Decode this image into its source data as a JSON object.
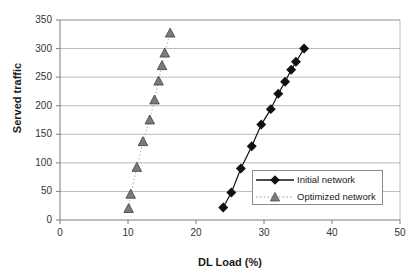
{
  "chart_data": {
    "type": "scatter",
    "title": "",
    "xlabel": "DL Load (%)",
    "ylabel": "Served traffic",
    "xlim": [
      0,
      50
    ],
    "ylim": [
      0,
      350
    ],
    "xticks": [
      0,
      10,
      20,
      30,
      40,
      50
    ],
    "yticks": [
      0,
      50,
      100,
      150,
      200,
      250,
      300,
      350
    ],
    "grid": "horizontal",
    "legend_position": "inside-lower-right",
    "series": [
      {
        "name": "Initial network",
        "marker": "diamond",
        "color": "#111111",
        "line": "solid",
        "points": [
          {
            "x": 24.0,
            "y": 22
          },
          {
            "x": 25.2,
            "y": 48
          },
          {
            "x": 26.6,
            "y": 90
          },
          {
            "x": 28.2,
            "y": 129
          },
          {
            "x": 29.6,
            "y": 167
          },
          {
            "x": 31.0,
            "y": 194
          },
          {
            "x": 32.1,
            "y": 221
          },
          {
            "x": 33.1,
            "y": 242
          },
          {
            "x": 34.0,
            "y": 263
          },
          {
            "x": 34.7,
            "y": 277
          },
          {
            "x": 35.9,
            "y": 300
          }
        ]
      },
      {
        "name": "Optimized network",
        "marker": "triangle",
        "color": "#6e6e6e",
        "line": "dotted",
        "points": [
          {
            "x": 10.1,
            "y": 20
          },
          {
            "x": 10.4,
            "y": 45
          },
          {
            "x": 11.3,
            "y": 92
          },
          {
            "x": 12.2,
            "y": 137
          },
          {
            "x": 13.2,
            "y": 175
          },
          {
            "x": 13.9,
            "y": 210
          },
          {
            "x": 14.5,
            "y": 243
          },
          {
            "x": 15.0,
            "y": 270
          },
          {
            "x": 15.4,
            "y": 292
          },
          {
            "x": 16.2,
            "y": 327
          }
        ]
      }
    ]
  },
  "legend": {
    "items": [
      {
        "label": "Initial network"
      },
      {
        "label": "Optimized network"
      }
    ]
  },
  "axes": {
    "x_title": "DL Load (%)",
    "y_title": "Served traffic"
  }
}
